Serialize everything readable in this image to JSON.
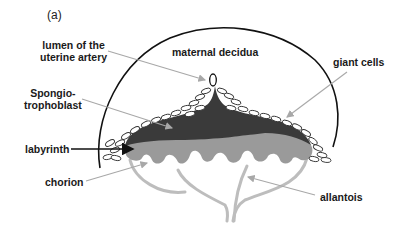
{
  "figure": {
    "panel_label": "(a)",
    "labels": {
      "lumen_line1": "lumen of the",
      "lumen_line2": "uterine artery",
      "maternal_decidua": "maternal decidua",
      "giant_cells": "giant cells",
      "spongio_line1": "Spongio-",
      "spongio_line2": "trophoblast",
      "labyrinth": "labyrinth",
      "chorion": "chorion",
      "allantois": "allantois"
    },
    "colors": {
      "spongiotrophoblast": "#3a3a3a",
      "labyrinth": "#9a9a9a",
      "pointer_gray": "#a8a8a8",
      "outline": "#111111"
    }
  }
}
